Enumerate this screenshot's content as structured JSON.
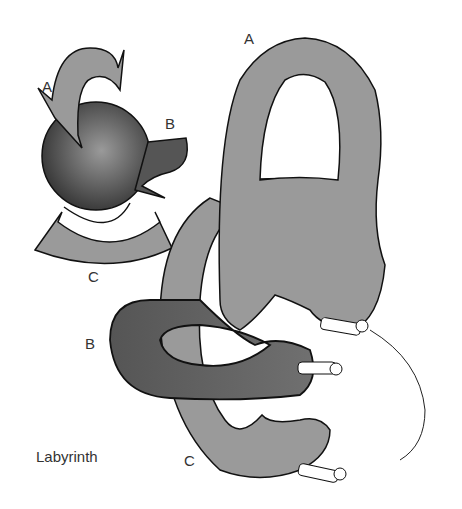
{
  "diagram": {
    "caption": "Labyrinth",
    "inset_labels": {
      "a": "A",
      "b": "B",
      "c": "C"
    },
    "main_labels": {
      "a": "A",
      "b": "B",
      "c": "C"
    },
    "colors": {
      "canal_gray": "#9a9a9a",
      "canal_dark": "#5c5c5c",
      "sphere_dark": "#3a3a3a",
      "sphere_light": "#8a8a8a",
      "outline": "#111111",
      "background": "#ffffff"
    }
  }
}
